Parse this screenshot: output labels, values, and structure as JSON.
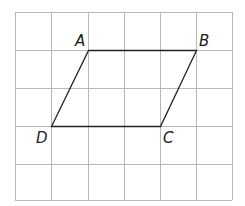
{
  "diagram": {
    "type": "parallelogram-on-grid",
    "grid": {
      "columns": 6,
      "rows": 5,
      "x_lines": [
        15,
        51,
        88,
        124,
        160,
        196,
        232
      ],
      "y_lines": [
        12,
        50,
        88,
        126,
        164,
        200
      ],
      "line_color": "#b8b8b8"
    },
    "shape": {
      "stroke_color": "#222222",
      "vertices": [
        {
          "label": "A",
          "x": 88,
          "y": 50,
          "label_x": 75,
          "label_y": 46
        },
        {
          "label": "B",
          "x": 196,
          "y": 50,
          "label_x": 199,
          "label_y": 46
        },
        {
          "label": "C",
          "x": 160,
          "y": 126,
          "label_x": 163,
          "label_y": 143
        },
        {
          "label": "D",
          "x": 51,
          "y": 126,
          "label_x": 36,
          "label_y": 143
        }
      ]
    }
  }
}
